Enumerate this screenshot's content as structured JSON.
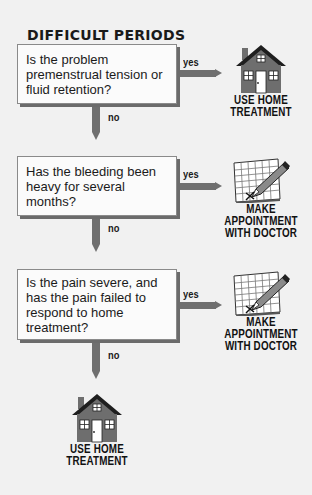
{
  "title": "DIFFICULT PERIODS",
  "colors": {
    "background": "#f1f1f1",
    "box_fill": "#fbfbfb",
    "box_shadow": "#6b6b6b",
    "arrow": "#6f6f6f",
    "house": "#6e6e6e",
    "text": "#1a1a1a"
  },
  "questions": [
    {
      "lines": [
        "Is the problem",
        "premenstrual tension or",
        "fluid retention?"
      ],
      "yes_label": "yes",
      "no_label": "no",
      "yes_outcome": {
        "icon": "house-icon",
        "lines": [
          "USE HOME",
          "TREATMENT"
        ]
      }
    },
    {
      "lines": [
        "Has the bleeding been",
        "heavy for several months?"
      ],
      "yes_label": "yes",
      "no_label": "no",
      "yes_outcome": {
        "icon": "calendar-pencil-icon",
        "lines": [
          "MAKE",
          "APPOINTMENT",
          "WITH DOCTOR"
        ]
      }
    },
    {
      "lines": [
        "Is the pain severe, and",
        "has the pain failed to",
        "respond to home",
        "treatment?"
      ],
      "yes_label": "yes",
      "no_label": "no",
      "yes_outcome": {
        "icon": "calendar-pencil-icon",
        "lines": [
          "MAKE",
          "APPOINTMENT",
          "WITH DOCTOR"
        ]
      }
    }
  ],
  "final_outcome": {
    "icon": "house-icon",
    "lines": [
      "USE HOME",
      "TREATMENT"
    ]
  }
}
